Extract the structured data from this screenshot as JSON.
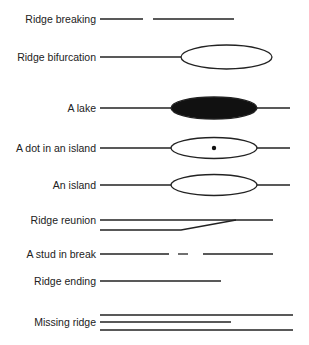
{
  "items": [
    {
      "label": "Ridge breaking",
      "type": "break"
    },
    {
      "label": "Ridge bifurcation",
      "type": "bifurcation"
    },
    {
      "label": "A lake",
      "type": "lake"
    },
    {
      "label": "A dot in an island",
      "type": "dot-island"
    },
    {
      "label": "An island",
      "type": "island"
    },
    {
      "label": "Ridge reunion",
      "type": "reunion"
    },
    {
      "label": "A stud in break",
      "type": "stud-break"
    },
    {
      "label": "Ridge ending",
      "type": "ending"
    },
    {
      "label": "Missing ridge",
      "type": "missing"
    }
  ],
  "colors": {
    "stroke": "#222222",
    "fill_dark": "#111111",
    "background": "#ffffff"
  }
}
